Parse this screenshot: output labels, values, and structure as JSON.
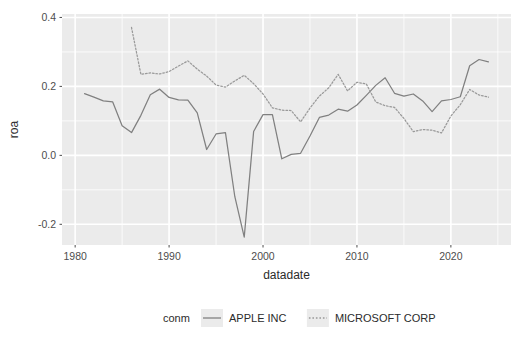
{
  "chart_data": {
    "type": "line",
    "title": "",
    "subtitle": "",
    "xlabel": "datadate",
    "ylabel": "roa",
    "xlim": [
      1978.6,
      2026.4
    ],
    "ylim": [
      -0.26,
      0.41
    ],
    "xticks": [
      1980,
      1990,
      2000,
      2010,
      2020
    ],
    "xtick_labels": [
      "1980",
      "1990",
      "2000",
      "2010",
      "2020"
    ],
    "yticks": [
      -0.2,
      0.0,
      0.2,
      0.4
    ],
    "ytick_labels": [
      "-0.2",
      "0.0",
      "0.2",
      "0.4"
    ],
    "grid": true,
    "grid_color": "#ffffff",
    "panel_background": "#ebebeb",
    "legend_position": "bottom",
    "legend_title": "conm",
    "series": [
      {
        "name": "APPLE INC",
        "linestyle": "solid",
        "color": "#808080",
        "x": [
          1981,
          1982,
          1983,
          1984,
          1985,
          1986,
          1987,
          1988,
          1989,
          1990,
          1991,
          1992,
          1993,
          1994,
          1995,
          1996,
          1997,
          1998,
          1999,
          2000,
          2001,
          2002,
          2003,
          2004,
          2005,
          2006,
          2007,
          2008,
          2009,
          2010,
          2011,
          2012,
          2013,
          2014,
          2015,
          2016,
          2017,
          2018,
          2019,
          2020,
          2021,
          2022,
          2023,
          2024
        ],
        "y": [
          0.179,
          0.169,
          0.158,
          0.155,
          0.086,
          0.066,
          0.116,
          0.176,
          0.192,
          0.168,
          0.161,
          0.16,
          0.123,
          0.017,
          0.062,
          0.066,
          -0.12,
          -0.237,
          0.069,
          0.118,
          0.118,
          -0.01,
          0.003,
          0.006,
          0.056,
          0.11,
          0.117,
          0.134,
          0.128,
          0.146,
          0.174,
          0.203,
          0.225,
          0.18,
          0.172,
          0.178,
          0.158,
          0.127,
          0.158,
          0.162,
          0.17,
          0.26,
          0.278,
          0.271
        ]
      },
      {
        "name": "MICROSOFT CORP",
        "linestyle": "dotted",
        "color": "#999999",
        "x": [
          1986,
          1987,
          1988,
          1989,
          1990,
          1991,
          1992,
          1993,
          1994,
          1995,
          1996,
          1997,
          1998,
          1999,
          2000,
          2001,
          2002,
          2003,
          2004,
          2005,
          2006,
          2007,
          2008,
          2009,
          2010,
          2011,
          2012,
          2013,
          2014,
          2015,
          2016,
          2017,
          2018,
          2019,
          2020,
          2021,
          2022,
          2023,
          2024
        ],
        "y": [
          0.371,
          0.235,
          0.239,
          0.236,
          0.243,
          0.259,
          0.274,
          0.25,
          0.23,
          0.204,
          0.198,
          0.216,
          0.232,
          0.208,
          0.178,
          0.138,
          0.131,
          0.13,
          0.097,
          0.137,
          0.172,
          0.196,
          0.235,
          0.187,
          0.212,
          0.207,
          0.155,
          0.144,
          0.139,
          0.107,
          0.069,
          0.075,
          0.073,
          0.065,
          0.114,
          0.147,
          0.191,
          0.175,
          0.169
        ]
      }
    ]
  },
  "legend": {
    "title": "conm",
    "entries": [
      {
        "label": "APPLE INC",
        "style": "solid"
      },
      {
        "label": "MICROSOFT CORP",
        "style": "dotted"
      }
    ]
  },
  "axes": {
    "x_title": "datadate",
    "y_title": "roa"
  }
}
